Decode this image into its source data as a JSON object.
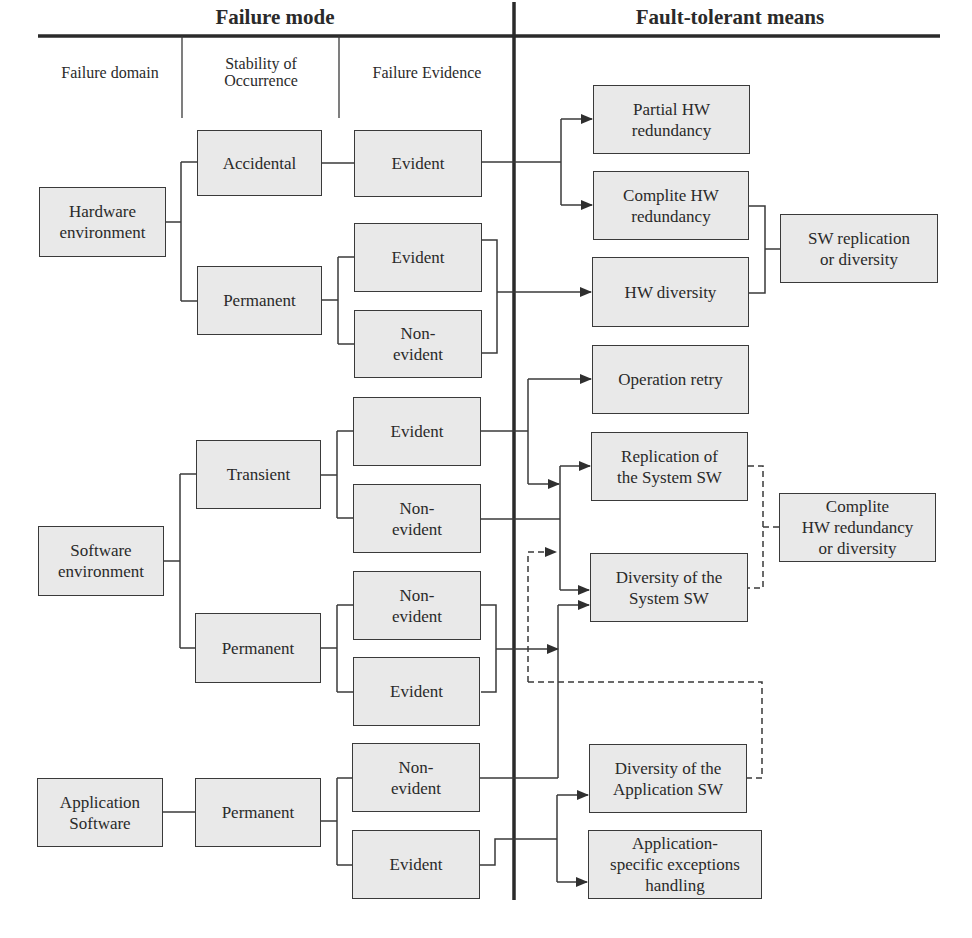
{
  "headings": {
    "failure_mode": "Failure mode",
    "fault_tolerant_means": "Fault-tolerant means"
  },
  "column_headers": {
    "failure_domain": "Failure domain",
    "stability": "Stability of\nOccurrence",
    "evidence": "Failure Evidence"
  },
  "failure_domains": {
    "hardware": "Hardware\nenvironment",
    "software": "Software\nenvironment",
    "application": "Application\nSoftware"
  },
  "stability": {
    "hw_accidental": "Accidental",
    "hw_permanent": "Permanent",
    "sw_transient": "Transient",
    "sw_permanent": "Permanent",
    "app_permanent": "Permanent"
  },
  "evidence": {
    "hw_acc_evident": "Evident",
    "hw_perm_evident": "Evident",
    "hw_perm_nonevident": "Non-\nevident",
    "sw_tr_evident": "Evident",
    "sw_tr_nonevident": "Non-\nevident",
    "sw_perm_nonevident": "Non-\nevident",
    "sw_perm_evident": "Evident",
    "app_nonevident": "Non-\nevident",
    "app_evident": "Evident"
  },
  "means": {
    "partial_hw_redundancy": "Partial HW\nredundancy",
    "complite_hw_redundancy": "Complite HW\nredundancy",
    "hw_diversity": "HW diversity",
    "sw_replication_or_diversity": "SW replication\nor diversity",
    "operation_retry": "Operation retry",
    "replication_system_sw": "Replication of\nthe System SW",
    "diversity_system_sw": "Diversity of  the\nSystem SW",
    "complite_hw_redundancy_or_diversity": "Complite\nHW redundancy\nor diversity",
    "diversity_application_sw": "Diversity of  the\nApplication  SW",
    "app_specific_exceptions": "Application-\nspecific exceptions\nhandling"
  },
  "colors": {
    "box_fill": "#e9e9e9",
    "line": "#3a3a3a",
    "divider": "#2a2a2a"
  }
}
